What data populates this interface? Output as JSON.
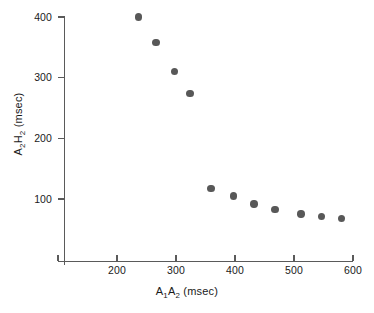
{
  "chart_data": {
    "type": "scatter",
    "title": "",
    "xlabel": "A₁A₂ (msec)",
    "ylabel": "A₂H₂ (msec)",
    "xlabel_parts": {
      "pre": "A",
      "sub1": "1",
      "mid": "A",
      "sub2": "2",
      "post": " (msec)"
    },
    "ylabel_parts": {
      "pre": "A",
      "sub1": "2",
      "mid": "H",
      "sub2": "2",
      "post": " (msec)"
    },
    "xlim": [
      100,
      600
    ],
    "ylim": [
      0,
      420
    ],
    "xticks": [
      100,
      200,
      300,
      400,
      500,
      600
    ],
    "xticklabels": [
      "",
      "200",
      "300",
      "400",
      "500",
      "600"
    ],
    "yticks": [
      100,
      200,
      300,
      400
    ],
    "yticklabels": [
      "100",
      "200",
      "300",
      "400"
    ],
    "grid": false,
    "legend": null,
    "marker_color": "#585858",
    "axis_color": "#5a5a5a",
    "x": [
      236,
      266,
      297,
      324,
      359,
      397,
      432,
      468,
      512,
      547,
      581
    ],
    "y": [
      400,
      358,
      310,
      274,
      117,
      105,
      92,
      83,
      75,
      71,
      68
    ],
    "points": [
      {
        "x": 236,
        "y": 400
      },
      {
        "x": 266,
        "y": 358
      },
      {
        "x": 297,
        "y": 310
      },
      {
        "x": 324,
        "y": 274
      },
      {
        "x": 359,
        "y": 117
      },
      {
        "x": 397,
        "y": 105
      },
      {
        "x": 432,
        "y": 92
      },
      {
        "x": 468,
        "y": 83
      },
      {
        "x": 512,
        "y": 75
      },
      {
        "x": 547,
        "y": 71
      },
      {
        "x": 581,
        "y": 68
      }
    ]
  }
}
